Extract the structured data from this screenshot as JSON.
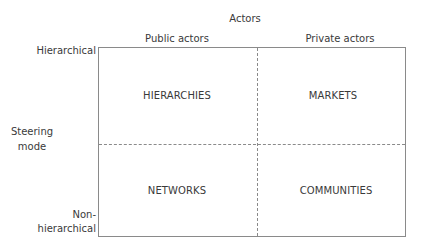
{
  "diagram": {
    "x_axis": {
      "title": "Actors",
      "categories": [
        "Public actors",
        "Private actors"
      ]
    },
    "y_axis": {
      "title_line1": "Steering",
      "title_line2": "mode",
      "top_label": "Hierarchical",
      "bottom_label_line1": "Non-",
      "bottom_label_line2": "hierarchical"
    },
    "quadrants": {
      "top_left": "HIERARCHIES",
      "top_right": "MARKETS",
      "bottom_left": "NETWORKS",
      "bottom_right": "COMMUNITIES"
    },
    "colors": {
      "text": "#3a3a3a",
      "lines": "#8a8a8a"
    }
  }
}
